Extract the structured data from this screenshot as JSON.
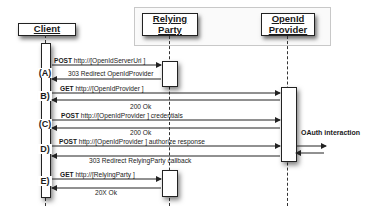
{
  "diagram": {
    "type": "sequence",
    "participants": [
      {
        "id": "client",
        "label": "Client"
      },
      {
        "id": "relying_party",
        "label_line1": "Relying",
        "label_line2": "Party"
      },
      {
        "id": "openid_provider",
        "label_line1": "OpenId",
        "label_line2": "Provider"
      }
    ],
    "steps": [
      {
        "id": "A",
        "label": "(A)"
      },
      {
        "id": "B",
        "label": "B)"
      },
      {
        "id": "C",
        "label": "(C)"
      },
      {
        "id": "D",
        "label": "D)"
      },
      {
        "id": "E",
        "label": "E)"
      }
    ],
    "messages": [
      {
        "verb": "POST",
        "text": " http://[OpenIdServerUri ]",
        "from": "client",
        "to": "relying_party"
      },
      {
        "verb": "",
        "text": "303 Redirect   OpenIdProvider",
        "from": "relying_party",
        "to": "client"
      },
      {
        "verb": "GET",
        "text": " http://[OpenIdProvider ]",
        "from": "client",
        "to": "openid_provider"
      },
      {
        "verb": "",
        "text": "200 Ok",
        "from": "openid_provider",
        "to": "client"
      },
      {
        "verb": "POST",
        "text": " http://[OpenIdProvider ] credentials",
        "from": "client",
        "to": "openid_provider"
      },
      {
        "verb": "",
        "text": "200 Ok",
        "from": "openid_provider",
        "to": "client"
      },
      {
        "verb": "POST",
        "text": " http://[OpenIdProvider ] authorize response",
        "from": "client",
        "to": "openid_provider"
      },
      {
        "verb": "",
        "text": "303 Redirect RelyingParty callback",
        "from": "openid_provider",
        "to": "client"
      },
      {
        "verb": "GET",
        "text": " http://[RelyingParty ]",
        "from": "client",
        "to": "relying_party"
      },
      {
        "verb": "",
        "text": "20X Ok",
        "from": "relying_party",
        "to": "client"
      }
    ],
    "side_note": "OAuth interaction"
  }
}
